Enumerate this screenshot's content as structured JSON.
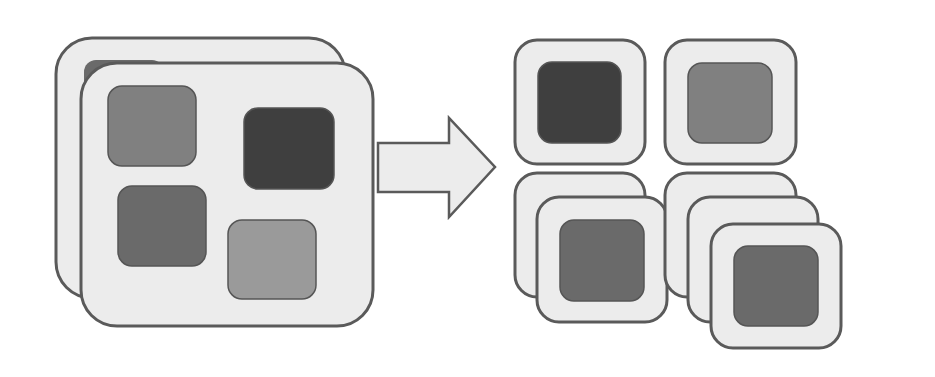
{
  "diagram": {
    "colors": {
      "background": "#ffffff",
      "container_fill": "#ececec",
      "container_stroke": "#5a5a5a",
      "item_darkest": "#3f3f3f",
      "item_mid_dark": "#6a6a6a",
      "item_mid": "#808080",
      "item_light": "#9a9a9a",
      "arrow_fill": "#ececec",
      "arrow_stroke": "#5a5a5a"
    },
    "source_group": {
      "containers": [
        {
          "id": "big-back",
          "x": 56,
          "y": 38,
          "w": 289,
          "h": 260,
          "r": 36
        },
        {
          "id": "big-front",
          "x": 81,
          "y": 63,
          "w": 292,
          "h": 263,
          "r": 36
        }
      ],
      "items": [
        {
          "id": "item-a",
          "x": 108,
          "y": 86,
          "w": 88,
          "h": 80,
          "shade": "item_mid"
        },
        {
          "id": "item-b",
          "x": 244,
          "y": 108,
          "w": 90,
          "h": 81,
          "shade": "item_darkest"
        },
        {
          "id": "item-c",
          "x": 118,
          "y": 186,
          "w": 88,
          "h": 80,
          "shade": "item_mid_dark"
        },
        {
          "id": "item-d",
          "x": 228,
          "y": 220,
          "w": 88,
          "h": 79,
          "shade": "item_light"
        }
      ]
    },
    "arrow": {
      "points": "378,143 449,143 449,118 495,167 449,217 449,192 378,192"
    },
    "target_groups": [
      {
        "id": "target-top-left",
        "containers": [
          {
            "x": 515,
            "y": 40,
            "w": 130,
            "h": 124,
            "r": 22
          }
        ],
        "item": {
          "x": 538,
          "y": 62,
          "w": 83,
          "h": 81,
          "shade": "item_darkest"
        }
      },
      {
        "id": "target-top-right",
        "containers": [
          {
            "x": 665,
            "y": 40,
            "w": 131,
            "h": 124,
            "r": 22
          }
        ],
        "item": {
          "x": 688,
          "y": 63,
          "w": 84,
          "h": 80,
          "shade": "item_mid"
        }
      },
      {
        "id": "target-bottom-left",
        "containers": [
          {
            "x": 515,
            "y": 173,
            "w": 130,
            "h": 124,
            "r": 22
          },
          {
            "x": 537,
            "y": 197,
            "w": 130,
            "h": 125,
            "r": 22
          }
        ],
        "item": {
          "x": 560,
          "y": 220,
          "w": 84,
          "h": 81,
          "shade": "item_mid_dark"
        }
      },
      {
        "id": "target-bottom-right",
        "containers": [
          {
            "x": 665,
            "y": 173,
            "w": 131,
            "h": 124,
            "r": 22
          },
          {
            "x": 688,
            "y": 197,
            "w": 130,
            "h": 125,
            "r": 22
          },
          {
            "x": 711,
            "y": 224,
            "w": 130,
            "h": 124,
            "r": 22
          }
        ],
        "item": {
          "x": 734,
          "y": 246,
          "w": 84,
          "h": 80,
          "shade": "item_mid_dark"
        }
      }
    ]
  }
}
